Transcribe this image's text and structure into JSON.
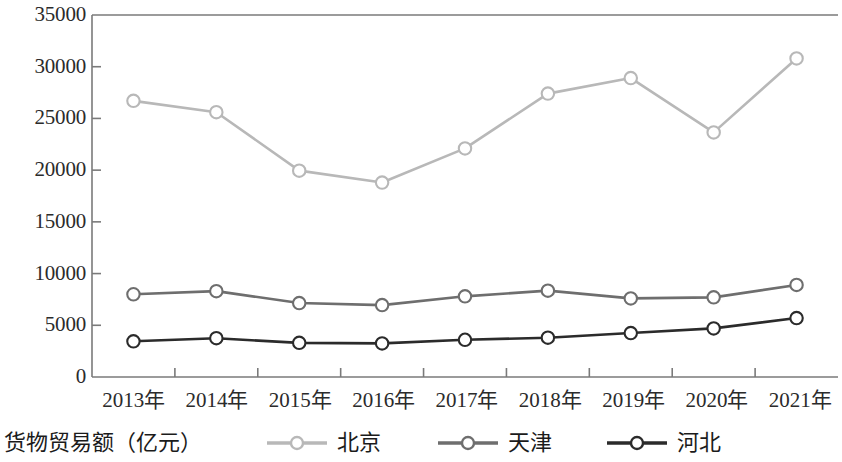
{
  "legend": {
    "axis_title": "货物贸易额（亿元）",
    "entries": [
      {
        "label": "北京",
        "color": "#b8b8b8",
        "marker": "open-circle"
      },
      {
        "label": "天津",
        "color": "#6e6e6e",
        "marker": "open-circle"
      },
      {
        "label": "河北",
        "color": "#2b2b2b",
        "marker": "open-circle"
      }
    ]
  },
  "chart_data": {
    "type": "line",
    "title": "",
    "subtitle": "",
    "xlabel": "",
    "ylabel": "货物贸易额（亿元）",
    "x": [
      "2013年",
      "2014年",
      "2015年",
      "2016年",
      "2017年",
      "2018年",
      "2019年",
      "2020年",
      "2021年"
    ],
    "categories": [
      "2013年",
      "2014年",
      "2015年",
      "2016年",
      "2017年",
      "2018年",
      "2019年",
      "2020年",
      "2021年"
    ],
    "ylim": [
      0,
      35000
    ],
    "yticks": [
      0,
      5000,
      10000,
      15000,
      20000,
      25000,
      30000,
      35000
    ],
    "ytick_labels": [
      "0",
      "5000",
      "10000",
      "15000",
      "20000",
      "25000",
      "30000",
      "35000"
    ],
    "grid": false,
    "legend_position": "bottom",
    "series": [
      {
        "name": "北京",
        "color": "#b8b8b8",
        "marker": "open-circle",
        "values": [
          26700,
          25600,
          19950,
          18800,
          22100,
          27400,
          28900,
          23650,
          30800
        ]
      },
      {
        "name": "天津",
        "color": "#6e6e6e",
        "marker": "open-circle",
        "values": [
          8000,
          8300,
          7150,
          6950,
          7800,
          8350,
          7600,
          7700,
          8900
        ]
      },
      {
        "name": "河北",
        "color": "#2b2b2b",
        "marker": "open-circle",
        "values": [
          3450,
          3750,
          3300,
          3250,
          3600,
          3800,
          4250,
          4700,
          5700
        ]
      }
    ]
  },
  "axes": {
    "frame_color": "#7a7a7a",
    "tick_color": "#7a7a7a"
  }
}
